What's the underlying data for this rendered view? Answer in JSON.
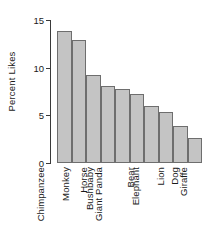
{
  "chart_data": {
    "type": "bar",
    "title": "",
    "xlabel": "",
    "ylabel": "Percent Likes",
    "categories": [
      "Chimpanzee",
      "Monkey",
      "Horse",
      "Bushbaby",
      "Giant Panda",
      "Bear",
      "Elephant",
      "Lion",
      "Dog",
      "Giraffe"
    ],
    "values": [
      13.8,
      12.9,
      9.2,
      8.1,
      7.8,
      7.2,
      6.0,
      5.4,
      3.9,
      2.6
    ],
    "ylim": [
      0,
      15
    ],
    "yticks": [
      0,
      5,
      10,
      15
    ],
    "ytick_labels": [
      "0",
      "5",
      "10",
      "15"
    ],
    "grid": false,
    "legend": "none",
    "bar_fill_color": "#c4c4c4",
    "bar_edge_color": "#6e6e6e",
    "axis_color": "#3a3a3a",
    "text_color": "#1a1a1a",
    "background_color": "#ffffff"
  }
}
